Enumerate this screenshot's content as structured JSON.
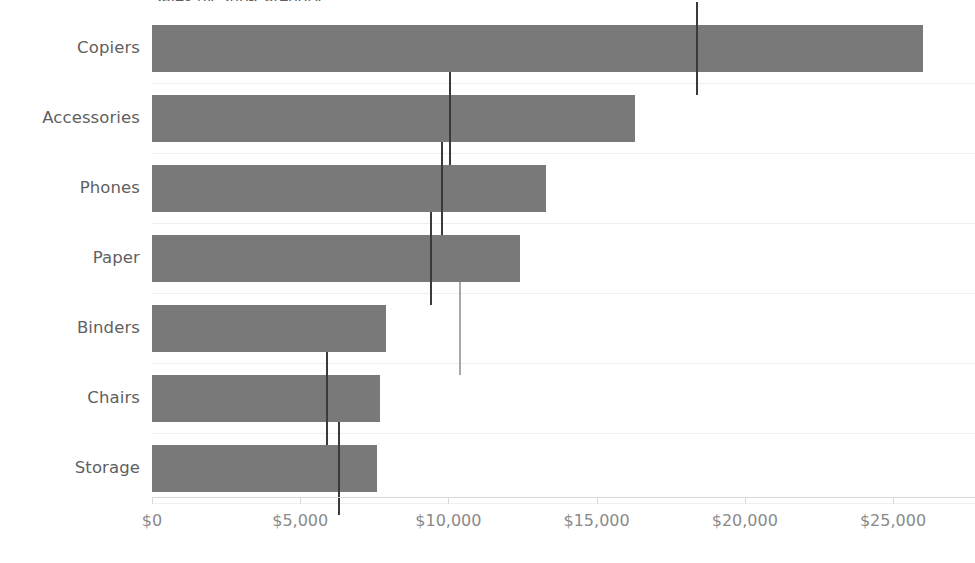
{
  "chart_data": {
    "type": "bar",
    "orientation": "horizontal",
    "title": "Sales by Sub-Category",
    "title_clipped": true,
    "xlabel": "",
    "ylabel": "",
    "categories": [
      "Copiers",
      "Accessories",
      "Phones",
      "Paper",
      "Binders",
      "Chairs",
      "Storage"
    ],
    "series": [
      {
        "name": "Sales",
        "values": [
          26000,
          16300,
          13300,
          12400,
          7900,
          7700,
          7600
        ]
      },
      {
        "name": "Reference",
        "values": [
          18400,
          10050,
          9800,
          9400,
          10400,
          5900,
          6300
        ]
      }
    ],
    "xlim": [
      0,
      25000
    ],
    "xticks": [
      0,
      5000,
      10000,
      15000,
      20000,
      25000
    ],
    "xtick_labels": [
      "$0",
      "$5,000",
      "$10,000",
      "$15,000",
      "$20,000",
      "$25,000"
    ],
    "grid": false,
    "legend": "none",
    "bar_color": "#797979",
    "reference_line_color": "#3a3a3a",
    "reference_line_color_outside": "#a8a8a8",
    "axis_color": "#d9d9d9",
    "label_color": "#5f5f5f",
    "tick_label_color": "#8a8a8a",
    "background": "#ffffff"
  },
  "rows": [
    {
      "category": "Copiers",
      "value": 26000,
      "reference": 18400,
      "reference_outside_bar": false
    },
    {
      "category": "Accessories",
      "value": 16300,
      "reference": 10050,
      "reference_outside_bar": false
    },
    {
      "category": "Phones",
      "value": 13300,
      "reference": 9800,
      "reference_outside_bar": false
    },
    {
      "category": "Paper",
      "value": 12400,
      "reference": 9400,
      "reference_outside_bar": false
    },
    {
      "category": "Binders",
      "value": 7900,
      "reference": 10400,
      "reference_outside_bar": true
    },
    {
      "category": "Chairs",
      "value": 7700,
      "reference": 5900,
      "reference_outside_bar": false
    },
    {
      "category": "Storage",
      "value": 7600,
      "reference": 6300,
      "reference_outside_bar": false
    }
  ]
}
